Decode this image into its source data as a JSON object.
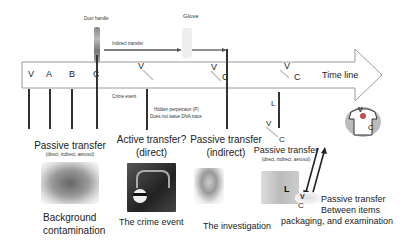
{
  "timeline": {
    "label": "Time line",
    "letters_before": [
      "V",
      "A",
      "B",
      "C"
    ]
  },
  "top": {
    "door_handle": "Door handle",
    "glove": "Glove",
    "indirect_transfer": "Indirect transfer"
  },
  "markers": {
    "crime_event": "Crime event",
    "hidden_perpetrator_1": "Hidden perpetrator (P)",
    "hidden_perpetrator_2": "Does not leave DNA trace",
    "v1": "V",
    "v2": "V",
    "c2": "C",
    "v3": "V",
    "c3": "C",
    "l": "L"
  },
  "stages": [
    {
      "title": "Passive transfer",
      "sub": "(direct, indirect, aerosol)",
      "caption_1": "Background",
      "caption_2": "contamination",
      "image": "crowd-image"
    },
    {
      "title": "Active transfer?",
      "sub": "(direct)",
      "caption_1": "The crime event",
      "image": "burglar-image"
    },
    {
      "title": "Passive transfer",
      "sub": "(indirect)",
      "caption_1": "The investigation",
      "image": "investigator-image"
    },
    {
      "title": "Passive transfer",
      "sub": "(direct, indirect, aerosol)",
      "caption_1": "",
      "image": "lab-image",
      "image_letter": "L"
    }
  ],
  "items": {
    "v_label": "V",
    "c_label": "C",
    "shirt_v": "V",
    "shirt_c": "C",
    "bag_v": "V",
    "bag_c": "C",
    "caption_1": "Passive transfer",
    "caption_2": "Between items",
    "caption_3": "packaging, and examination"
  },
  "colors": {
    "arrow_stroke": "#9a9a9a",
    "line": "#333333",
    "stain": "#c0504d"
  }
}
